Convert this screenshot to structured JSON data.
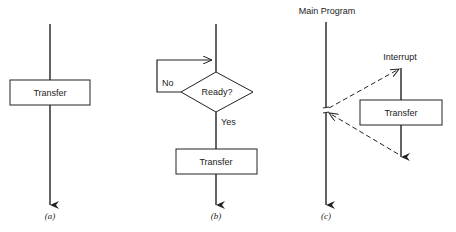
{
  "diagrams": [
    {
      "id": "a",
      "caption": "(a)",
      "box_label": "Transfer"
    },
    {
      "id": "b",
      "caption": "(b)",
      "decision_label": "Ready?",
      "no_label": "No",
      "yes_label": "Yes",
      "box_label": "Transfer"
    },
    {
      "id": "c",
      "caption": "(c)",
      "main_label": "Main Program",
      "interrupt_label": "Interrupt",
      "box_label": "Transfer"
    }
  ],
  "colors": {
    "line": "#222222",
    "background": "#ffffff"
  }
}
